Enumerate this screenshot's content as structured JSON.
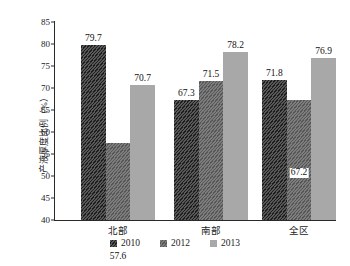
{
  "chart_data": {
    "type": "bar",
    "title": "",
    "xlabel": "",
    "ylabel": "产液厚度比例（%）",
    "ylim": [
      40,
      85
    ],
    "ytick_step": 5,
    "yticks": [
      "85",
      "80",
      "75",
      "70",
      "65",
      "60",
      "55",
      "50",
      "45",
      "40"
    ],
    "grid": false,
    "legend_position": "bottom",
    "categories": [
      "北部",
      "南部",
      "全区"
    ],
    "series": [
      {
        "name": "2010",
        "color": "#585858",
        "pattern": "diagonal-hatch",
        "values": [
          79.7,
          67.3,
          71.8
        ]
      },
      {
        "name": "2012",
        "color": "#7d7d7d",
        "pattern": "fine-diagonal-hatch",
        "values": [
          57.6,
          71.5,
          67.2
        ]
      },
      {
        "name": "2013",
        "color": "#a8a8a8",
        "pattern": "solid",
        "values": [
          70.7,
          78.2,
          76.9
        ]
      }
    ],
    "data_labels": [
      [
        "79.7",
        "57.6",
        "70.7"
      ],
      [
        "67.3",
        "71.5",
        "78.2"
      ],
      [
        "71.8",
        "67.2",
        "76.9"
      ]
    ]
  },
  "caption": {
    "text": ""
  }
}
